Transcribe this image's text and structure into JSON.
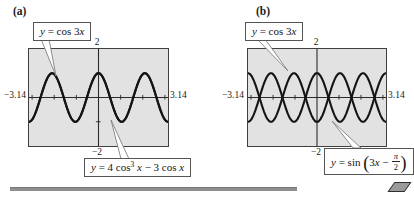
{
  "figure": {
    "panels": [
      {
        "letter": "(a)"
      },
      {
        "letter": "(b)"
      }
    ]
  },
  "labels": {
    "a_top": [
      {
        "t": "y",
        "i": 1
      },
      {
        "t": " = cos 3"
      },
      {
        "t": "x",
        "i": 1
      }
    ],
    "a_bottom": [
      {
        "t": "y",
        "i": 1
      },
      {
        "t": " = 4 cos"
      },
      {
        "t": "3",
        "sup": 1
      },
      {
        "t": " "
      },
      {
        "t": "x",
        "i": 1
      },
      {
        "t": " − 3 cos "
      },
      {
        "t": "x",
        "i": 1
      }
    ],
    "b_top": [
      {
        "t": "y",
        "i": 1
      },
      {
        "t": " = cos 3"
      },
      {
        "t": "x",
        "i": 1
      }
    ],
    "b_bottom": [
      {
        "t": "y",
        "i": 1
      },
      {
        "t": " = sin "
      },
      {
        "t": "(",
        "big": 1
      },
      {
        "t": "3"
      },
      {
        "t": "x",
        "i": 1
      },
      {
        "t": " − ",
        "i": 0
      },
      {
        "num": "π",
        "den": "2"
      },
      {
        "t": ")",
        "big": 1
      }
    ]
  },
  "chart_data": [
    {
      "type": "line",
      "panel": "(a)",
      "window": {
        "xmin": -3.14,
        "xmax": 3.14,
        "ymin": -2,
        "ymax": 2,
        "xscl": 1,
        "yscl": 1
      },
      "tick_labels": {
        "xmin": "−3.14",
        "xmax": "3.14",
        "ymax": "2",
        "ymin": "−2"
      },
      "grid": false,
      "series": [
        {
          "name": "y = cos 3x",
          "formula": {
            "type": "coslin",
            "a": 3,
            "b": 0
          }
        },
        {
          "name": "y = 4 cos³ x − 3 cos x",
          "formula": {
            "type": "cospoly",
            "terms": [
              [
                4,
                3
              ],
              [
                -3,
                1
              ]
            ]
          }
        }
      ],
      "note": "the two curves coincide exactly (triple-angle identity)"
    },
    {
      "type": "line",
      "panel": "(b)",
      "window": {
        "xmin": -3.14,
        "xmax": 3.14,
        "ymin": -2,
        "ymax": 2,
        "xscl": 1,
        "yscl": 1
      },
      "tick_labels": {
        "xmin": "−3.14",
        "xmax": "3.14",
        "ymax": "2",
        "ymin": "−2"
      },
      "grid": false,
      "series": [
        {
          "name": "y = cos 3x",
          "formula": {
            "type": "coslin",
            "a": 3,
            "b": 0
          }
        },
        {
          "name": "y = sin(3x − π/2)",
          "formula": {
            "type": "sinlin",
            "a": 3,
            "b": -1.5707963
          }
        }
      ],
      "note": "the two curves are reflections of each other across the x-axis"
    }
  ],
  "colors": {
    "curve": "#141414",
    "axis": "#2a2a2a",
    "plot_bg": "#e2e2e2",
    "plot_border": "#3f3f3f"
  }
}
